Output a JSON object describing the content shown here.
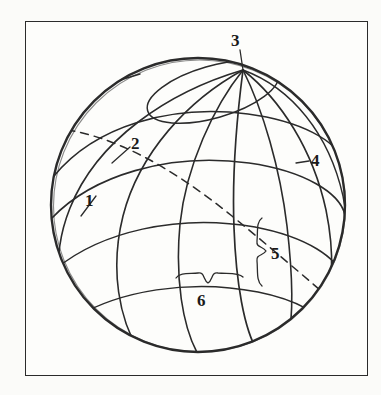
{
  "figure": {
    "type": "globe-graticule-diagram",
    "background_color": "#fbfbf9",
    "line_color": "#2b2b2b",
    "frame": {
      "name": "figure-border",
      "x": 25,
      "y": 21,
      "width": 343,
      "height": 355
    },
    "sphere": {
      "center_x": 198,
      "center_y": 205,
      "radius": 147,
      "pole_x": 243,
      "pole_y": 70
    }
  },
  "callouts": [
    {
      "id": "1",
      "label": "1",
      "kind": "leader-line",
      "points_to": "parallel-of-latitude",
      "label_x": 85,
      "label_y": 192
    },
    {
      "id": "2",
      "label": "2",
      "kind": "leader-line",
      "points_to": "meridian-of-longitude",
      "label_x": 131,
      "label_y": 135
    },
    {
      "id": "3",
      "label": "3",
      "kind": "leader-line",
      "points_to": "pole-convergence-point",
      "label_x": 231,
      "label_y": 32
    },
    {
      "id": "4",
      "label": "4",
      "kind": "leader-line",
      "points_to": "meridian-near-limb",
      "label_x": 311,
      "label_y": 152
    },
    {
      "id": "5",
      "label": "5",
      "kind": "vertical-brace",
      "points_to": "latitude-arc-interval",
      "label_x": 271,
      "label_y": 245
    },
    {
      "id": "6",
      "label": "6",
      "kind": "horizontal-brace",
      "points_to": "longitude-arc-interval",
      "label_x": 197,
      "label_y": 292
    }
  ],
  "caption_mark": ""
}
